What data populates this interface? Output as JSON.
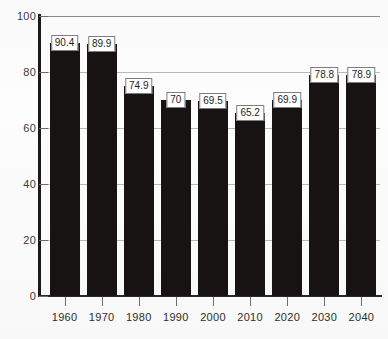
{
  "chart_data": {
    "type": "bar",
    "title": "",
    "subtitle": "",
    "xlabel": "",
    "ylabel": "",
    "categories": [
      "1960",
      "1970",
      "1980",
      "1990",
      "2000",
      "2010",
      "2020",
      "2030",
      "2040"
    ],
    "values": [
      90.4,
      89.9,
      74.9,
      70,
      69.5,
      65.2,
      69.9,
      78.8,
      78.9
    ],
    "value_labels": [
      "90.4",
      "89.9",
      "74.9",
      "70",
      "69.5",
      "65.2",
      "69.9",
      "78.8",
      "78.9"
    ],
    "ylim": [
      0,
      100
    ],
    "y_ticks": [
      0,
      20,
      40,
      60,
      80,
      100
    ],
    "y_tick_labels": [
      "0",
      "20",
      "40",
      "60",
      "80",
      "100"
    ],
    "grid": true,
    "legend": false,
    "legend_position": "none",
    "bar_color": "#171313",
    "gridline_color": "#b9b9b9",
    "axis_color": "#1a1a1a",
    "label_box_background": "#ffffff",
    "label_box_border": "#7d7d7d"
  }
}
